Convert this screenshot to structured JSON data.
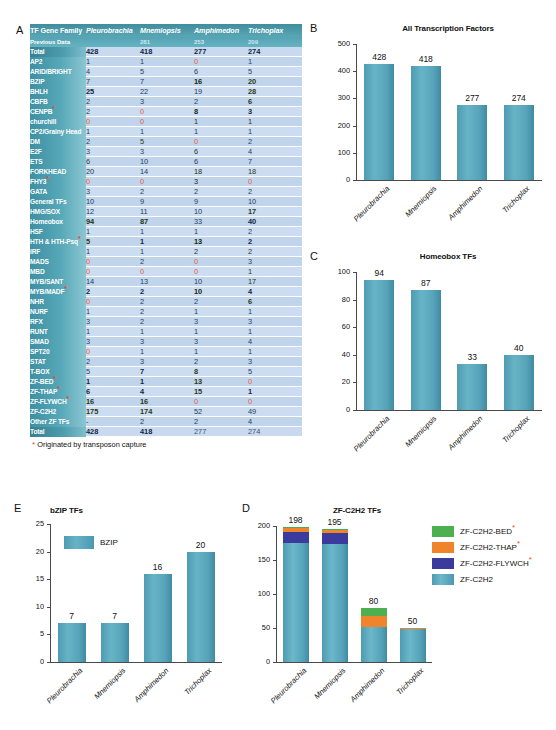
{
  "panels": {
    "a": {
      "letter": "A"
    },
    "b": {
      "letter": "B"
    },
    "c": {
      "letter": "C"
    },
    "d": {
      "letter": "D"
    },
    "e": {
      "letter": "E"
    }
  },
  "table": {
    "headers": [
      "TF Gene Family",
      "Pleurobrachia",
      "Mnemiopsis",
      "Amphimedon",
      "Trichoplax"
    ],
    "previous_data": {
      "label": "Previous Data",
      "values": [
        "",
        "281",
        "253",
        "209"
      ]
    },
    "footnote": "Originated by transposon capture",
    "footnote_marker": "*",
    "rows": [
      {
        "family": "Total",
        "transposon": false,
        "total": true,
        "values": [
          "428",
          "418",
          "277",
          "274"
        ]
      },
      {
        "family": "AP2",
        "transposon": false,
        "values": [
          "1",
          "1",
          "0",
          "1"
        ]
      },
      {
        "family": "ARID/BRIGHT",
        "transposon": false,
        "values": [
          "4",
          "5",
          "6",
          "5"
        ]
      },
      {
        "family": "BZIP",
        "transposon": false,
        "values": [
          "7",
          "7",
          "16",
          "20"
        ]
      },
      {
        "family": "BHLH",
        "transposon": false,
        "values": [
          "25",
          "22",
          "19",
          "28"
        ]
      },
      {
        "family": "CBFB",
        "transposon": false,
        "values": [
          "2",
          "3",
          "2",
          "6"
        ]
      },
      {
        "family": "CENPB",
        "transposon": true,
        "values": [
          "2",
          "0",
          "8",
          "3"
        ]
      },
      {
        "family": "churchill",
        "transposon": false,
        "values": [
          "0",
          "0",
          "1",
          "1"
        ]
      },
      {
        "family": "CP2/Grainy Head",
        "transposon": false,
        "values": [
          "1",
          "1",
          "1",
          "1"
        ]
      },
      {
        "family": "DM",
        "transposon": false,
        "values": [
          "2",
          "5",
          "0",
          "2"
        ]
      },
      {
        "family": "E2F",
        "transposon": false,
        "values": [
          "3",
          "3",
          "6",
          "4"
        ]
      },
      {
        "family": "ETS",
        "transposon": false,
        "values": [
          "6",
          "10",
          "6",
          "7"
        ]
      },
      {
        "family": "FORKHEAD",
        "transposon": false,
        "values": [
          "20",
          "14",
          "18",
          "18"
        ]
      },
      {
        "family": "FHY3",
        "transposon": true,
        "values": [
          "0",
          "0",
          "3",
          "0"
        ]
      },
      {
        "family": "GATA",
        "transposon": false,
        "values": [
          "3",
          "2",
          "2",
          "2"
        ]
      },
      {
        "family": "General TFs",
        "transposon": false,
        "values": [
          "10",
          "9",
          "9",
          "10"
        ]
      },
      {
        "family": "HMG/SOX",
        "transposon": false,
        "values": [
          "12",
          "11",
          "10",
          "17"
        ]
      },
      {
        "family": "Homeobox",
        "transposon": false,
        "values": [
          "94",
          "87",
          "33",
          "40"
        ]
      },
      {
        "family": "HSF",
        "transposon": false,
        "values": [
          "1",
          "1",
          "1",
          "2"
        ]
      },
      {
        "family": "HTH & HTH-Psq",
        "transposon": true,
        "values": [
          "5",
          "1",
          "13",
          "2"
        ]
      },
      {
        "family": "IRF",
        "transposon": false,
        "values": [
          "1",
          "1",
          "2",
          "2"
        ]
      },
      {
        "family": "MADS",
        "transposon": false,
        "values": [
          "0",
          "2",
          "0",
          "3"
        ]
      },
      {
        "family": "MBD",
        "transposon": false,
        "values": [
          "0",
          "0",
          "0",
          "1"
        ]
      },
      {
        "family": "MYB/SANT",
        "transposon": false,
        "values": [
          "14",
          "13",
          "10",
          "17"
        ]
      },
      {
        "family": "MYB/MADF",
        "transposon": true,
        "values": [
          "2",
          "2",
          "10",
          "4"
        ]
      },
      {
        "family": "NHR",
        "transposon": false,
        "values": [
          "0",
          "2",
          "2",
          "6"
        ]
      },
      {
        "family": "NURF",
        "transposon": false,
        "values": [
          "1",
          "2",
          "1",
          "1"
        ]
      },
      {
        "family": "RFX",
        "transposon": false,
        "values": [
          "3",
          "2",
          "3",
          "3"
        ]
      },
      {
        "family": "RUNT",
        "transposon": false,
        "values": [
          "1",
          "1",
          "1",
          "1"
        ]
      },
      {
        "family": "SMAD",
        "transposon": false,
        "values": [
          "3",
          "3",
          "3",
          "4"
        ]
      },
      {
        "family": "SPT20",
        "transposon": false,
        "values": [
          "0",
          "1",
          "1",
          "1"
        ]
      },
      {
        "family": "STAT",
        "transposon": false,
        "values": [
          "2",
          "3",
          "2",
          "3"
        ]
      },
      {
        "family": "T-BOX",
        "transposon": false,
        "values": [
          "5",
          "7",
          "8",
          "5"
        ]
      },
      {
        "family": "ZF-BED",
        "transposon": true,
        "values": [
          "1",
          "1",
          "13",
          "0"
        ]
      },
      {
        "family": "ZF-THAP",
        "transposon": true,
        "values": [
          "6",
          "4",
          "15",
          "1"
        ]
      },
      {
        "family": "ZF-FLYWCH",
        "transposon": true,
        "values": [
          "16",
          "16",
          "0",
          "0"
        ]
      },
      {
        "family": "ZF-C2H2",
        "transposon": false,
        "values": [
          "175",
          "174",
          "52",
          "49"
        ]
      },
      {
        "family": "Other ZF TFs",
        "transposon": false,
        "values": [
          "-",
          "2",
          "2",
          "4"
        ]
      },
      {
        "family": "Total",
        "transposon": false,
        "total": true,
        "values": [
          "428",
          "418",
          "277",
          "274"
        ]
      }
    ]
  },
  "chart_data": [
    {
      "panel": "B",
      "type": "bar",
      "title": "All Transcription Factors",
      "categories": [
        "Pleurobrachia",
        "Mnemiopsis",
        "Amphimedon",
        "Trichoplax"
      ],
      "values": [
        428,
        418,
        277,
        274
      ],
      "ylim": [
        0,
        500
      ],
      "yticks": [
        0,
        100,
        200,
        300,
        400,
        500
      ],
      "xlabel": "",
      "ylabel": "",
      "grid": false,
      "legend": null,
      "bar_color": "#4f9fb5"
    },
    {
      "panel": "C",
      "type": "bar",
      "title": "Homeobox TFs",
      "categories": [
        "Pleurobrachia",
        "Mnemiopsis",
        "Amphimedon",
        "Trichoplax"
      ],
      "values": [
        94,
        87,
        33,
        40
      ],
      "ylim": [
        0,
        100
      ],
      "yticks": [
        0,
        20,
        40,
        60,
        80,
        100
      ],
      "xlabel": "",
      "ylabel": "",
      "grid": false,
      "legend": null,
      "bar_color": "#4f9fb5"
    },
    {
      "panel": "E",
      "type": "bar",
      "title": "bZIP TFs",
      "categories": [
        "Pleurobrachia",
        "Mnemiopsis",
        "Amphimedon",
        "Trichoplax"
      ],
      "values": [
        7,
        7,
        16,
        20
      ],
      "ylim": [
        0,
        25
      ],
      "yticks": [
        0,
        5,
        10,
        15,
        20,
        25
      ],
      "xlabel": "",
      "ylabel": "",
      "grid": false,
      "legend": {
        "position": "inside-top-left",
        "entries": [
          {
            "label": "BZIP",
            "color": "#4f9fb5"
          }
        ]
      },
      "bar_color": "#4f9fb5"
    },
    {
      "panel": "D",
      "type": "bar",
      "stacked": true,
      "title": "ZF-C2H2 TFs",
      "categories": [
        "Pleurobrachia",
        "Mnemiopsis",
        "Amphimedon",
        "Trichoplax"
      ],
      "totals": [
        198,
        195,
        80,
        50
      ],
      "series": [
        {
          "name": "ZF-C2H2",
          "color": "#4f9fb5",
          "transposon": false,
          "values": [
            175,
            174,
            52,
            49
          ]
        },
        {
          "name": "ZF-C2H2-FLYWCH",
          "color": "#3b3b9e",
          "transposon": true,
          "values": [
            16,
            16,
            0,
            0
          ]
        },
        {
          "name": "ZF-C2H2-THAP",
          "color": "#f0842a",
          "transposon": true,
          "values": [
            6,
            4,
            15,
            1
          ]
        },
        {
          "name": "ZF-C2H2-BED",
          "color": "#4caf50",
          "transposon": true,
          "values": [
            1,
            1,
            13,
            0
          ]
        }
      ],
      "ylim": [
        0,
        200
      ],
      "yticks": [
        0,
        50,
        100,
        150,
        200
      ],
      "xlabel": "",
      "ylabel": "",
      "grid": false,
      "legend": {
        "position": "right",
        "marker": "*"
      }
    }
  ]
}
